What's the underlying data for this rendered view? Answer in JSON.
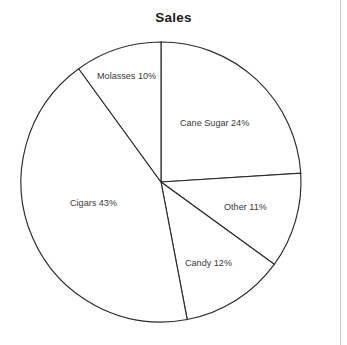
{
  "chart_data": {
    "type": "pie",
    "title": "Sales",
    "xlabel": "",
    "ylabel": "",
    "categories": [
      "Cane Sugar",
      "Other",
      "Candy",
      "Cigars",
      "Molasses"
    ],
    "values": [
      24,
      11,
      12,
      43,
      10
    ],
    "unit": "%",
    "labels": [
      "Cane Sugar 24%",
      "Other 11%",
      "Candy 12%",
      "Cigars 43%",
      "Molasses 10%"
    ],
    "slices": [
      {
        "name": "Cane Sugar",
        "value": 24,
        "label": "Cane Sugar 24%",
        "start_angle_deg": 0,
        "end_angle_deg": 86.4,
        "fill": "#ffffff",
        "stroke": "#2b2b2b",
        "label_x": 180,
        "label_y": 119
      },
      {
        "name": "Other",
        "value": 11,
        "label": "Other 11%",
        "start_angle_deg": 86.4,
        "end_angle_deg": 126.0,
        "fill": "#ffffff",
        "stroke": "#2b2b2b",
        "label_x": 224,
        "label_y": 203
      },
      {
        "name": "Candy",
        "value": 12,
        "label": "Candy 12%",
        "start_angle_deg": 126.0,
        "end_angle_deg": 169.2,
        "fill": "#ffffff",
        "stroke": "#2b2b2b",
        "label_x": 185,
        "label_y": 259
      },
      {
        "name": "Cigars",
        "value": 43,
        "label": "Cigars 43%",
        "start_angle_deg": 169.2,
        "end_angle_deg": 324.0,
        "fill": "#ffffff",
        "stroke": "#2b2b2b",
        "label_x": 70,
        "label_y": 199
      },
      {
        "name": "Molasses",
        "value": 10,
        "label": "Molasses 10%",
        "start_angle_deg": 324.0,
        "end_angle_deg": 360.0,
        "fill": "#ffffff",
        "stroke": "#2b2b2b",
        "label_x": 97,
        "label_y": 72
      }
    ],
    "total": 100,
    "grid": false,
    "legend": "none",
    "label_placement": "inside-slices",
    "geometry": {
      "center_x": 161,
      "center_y": 182,
      "radius": 140,
      "start_angle_deg": 0,
      "direction": "clockwise"
    },
    "colors": {
      "background": "#ffffff",
      "slice_fill": "#ffffff",
      "slice_stroke": "#2b2b2b",
      "title_color": "#1b1b1b",
      "label_color": "#3a3a3a",
      "page_edge": "#c9c9c9"
    }
  }
}
